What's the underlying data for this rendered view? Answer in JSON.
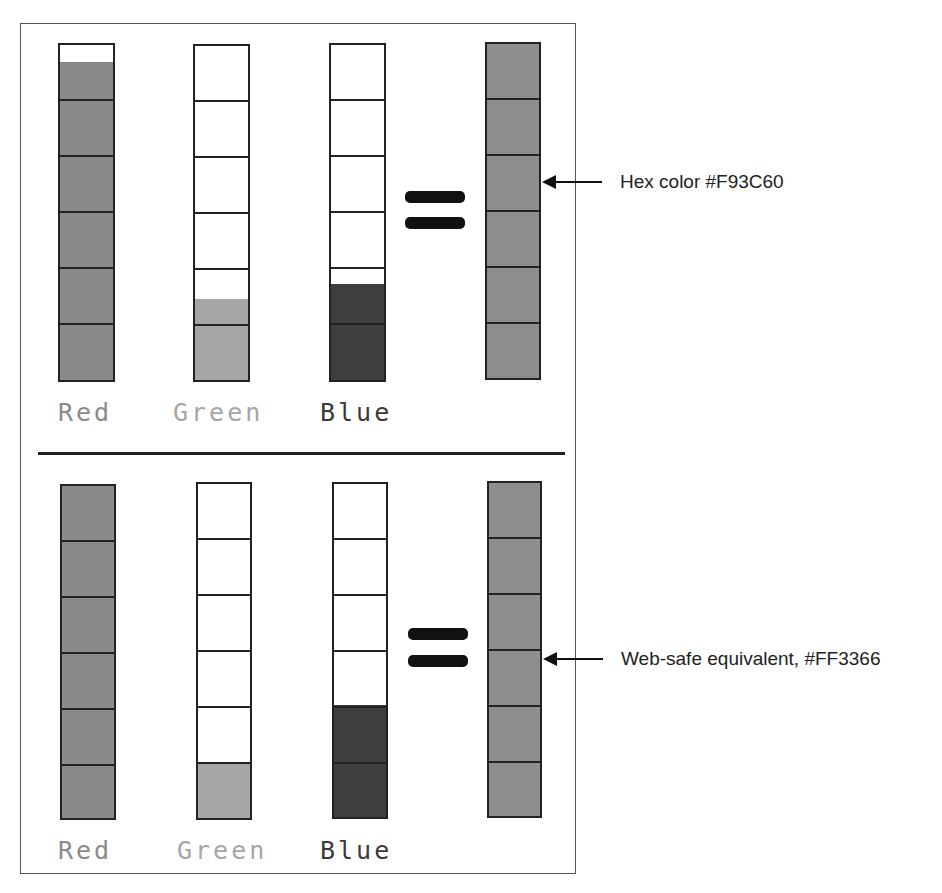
{
  "figure": {
    "sections": [
      {
        "id": "original",
        "channels": [
          {
            "label": "Red",
            "hex": "F9",
            "value": 249,
            "fill_fraction": 0.94,
            "fill_color": "#8a8a8a",
            "label_color": "#8a8a8a"
          },
          {
            "label": "Green",
            "hex": "3C",
            "value": 60,
            "fill_fraction": 0.24,
            "fill_color": "#a6a6a6",
            "label_color": "#a6a6a6"
          },
          {
            "label": "Blue",
            "hex": "60",
            "value": 96,
            "fill_fraction": 0.28,
            "fill_color": "#3e3e3e",
            "label_color": "#3a3a3a"
          }
        ],
        "equals_symbol": "=",
        "result_color": "#8e8e8e",
        "annotation": "Hex color #F93C60"
      },
      {
        "id": "web-safe",
        "channels": [
          {
            "label": "Red",
            "hex": "FF",
            "value": 255,
            "fill_fraction": 1.0,
            "fill_color": "#8a8a8a",
            "label_color": "#8a8a8a"
          },
          {
            "label": "Green",
            "hex": "33",
            "value": 51,
            "fill_fraction": 0.1667,
            "fill_color": "#a6a6a6",
            "label_color": "#a6a6a6"
          },
          {
            "label": "Blue",
            "hex": "66",
            "value": 102,
            "fill_fraction": 0.3333,
            "fill_color": "#3e3e3e",
            "label_color": "#3a3a3a"
          }
        ],
        "equals_symbol": "=",
        "result_color": "#8e8e8e",
        "annotation": "Web-safe equivalent, #FF3366"
      }
    ],
    "segments_per_column": 6
  }
}
